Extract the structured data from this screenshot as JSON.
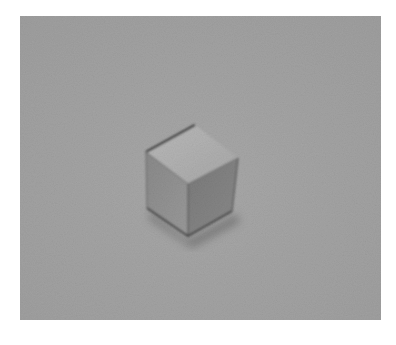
{
  "image": {
    "description": "Grayscale photograph of a small cube resting on a textured gray surface",
    "colors": {
      "background": "#ffffff",
      "surface": "#a3a3a3",
      "top_face": "#b2b2b2",
      "left_face": "#8e8e8e",
      "right_face": "#7e7e7e",
      "edge": "#3a3a3a",
      "shadow": "#5a5a5a"
    }
  }
}
